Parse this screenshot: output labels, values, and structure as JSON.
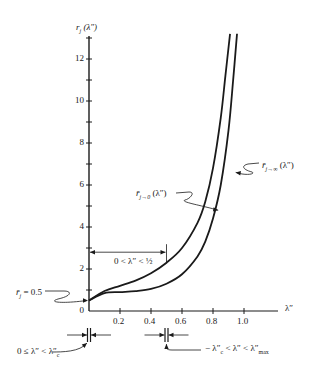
{
  "chart_data": {
    "type": "line",
    "title": "",
    "xlabel": "λ″",
    "ylabel": "r_j (λ″)",
    "xlim": [
      0,
      1.05
    ],
    "ylim": [
      0,
      13.2
    ],
    "x_ticks": [
      0.2,
      0.4,
      0.6,
      0.8,
      1.0
    ],
    "x_tick_labels": [
      "0.2",
      "0.4",
      "0.6",
      "0.8",
      "1.0"
    ],
    "y_ticks": [
      0,
      2,
      4,
      6,
      8,
      10,
      12
    ],
    "y_tick_labels": [
      "0",
      "2",
      "4",
      "6",
      "8",
      "10",
      "12"
    ],
    "y_minor_ticks": [
      1,
      3,
      5,
      7,
      9,
      11,
      13
    ],
    "grid": false,
    "series": [
      {
        "name": "r̄_{j→0}(λ″)",
        "x": [
          0.0,
          0.1,
          0.2,
          0.3,
          0.4,
          0.5,
          0.6,
          0.7,
          0.75,
          0.8,
          0.85,
          0.88,
          0.91
        ],
        "y": [
          0.5,
          0.95,
          1.2,
          1.45,
          1.8,
          2.3,
          3.0,
          4.2,
          5.2,
          6.8,
          9.2,
          11.2,
          13.2
        ]
      },
      {
        "name": "r̄_{j→∞}(λ″)",
        "x": [
          0.0,
          0.1,
          0.2,
          0.3,
          0.4,
          0.5,
          0.6,
          0.7,
          0.75,
          0.8,
          0.85,
          0.9,
          0.93,
          0.955
        ],
        "y": [
          0.5,
          0.85,
          0.9,
          0.95,
          1.05,
          1.3,
          1.75,
          2.6,
          3.3,
          4.4,
          6.0,
          8.6,
          11.0,
          13.2
        ]
      }
    ],
    "annotations": [
      {
        "text": "r̄_j = 0.5",
        "target": [
          0,
          0.5
        ]
      },
      {
        "text": "0 < λ″ < ½",
        "span_x": [
          0,
          0.5
        ],
        "y": 2.8
      },
      {
        "text": "r̄_{j→0}(λ″)",
        "target": [
          0.84,
          4.8
        ]
      },
      {
        "text": "r̄_{j→∞}(λ″)",
        "target": [
          0.92,
          6.6
        ]
      },
      {
        "text": "0 ≤ λ″ < λ″_c",
        "marker_x": 0
      },
      {
        "text": "−λ″_c < λ″ < λ″_max",
        "marker_x": 0.5
      }
    ]
  },
  "labels": {
    "ylabel_main": "r",
    "ylabel_sub": "j",
    "ylabel_arg": " (λ″)",
    "xlabel": "λ″",
    "rbar_label": "r̄",
    "rbar_sub": "j",
    "rbar_value": " = 0.5",
    "range_label": "0 < λ″ < ½",
    "curve0_main": "r̄",
    "curve0_sub": "j→0",
    "curve0_arg": " (λ″)",
    "curveinf_main": "r̄",
    "curveinf_sub": "j→∞",
    "curveinf_arg": " (λ″)",
    "bottom_left": "0 ≤ λ″ < λ″",
    "bottom_left_sub": "c",
    "bottom_right_pre": "− λ″",
    "bottom_right_sub1": "c",
    "bottom_right_mid": " < λ″ < λ″",
    "bottom_right_sub2": "max"
  }
}
